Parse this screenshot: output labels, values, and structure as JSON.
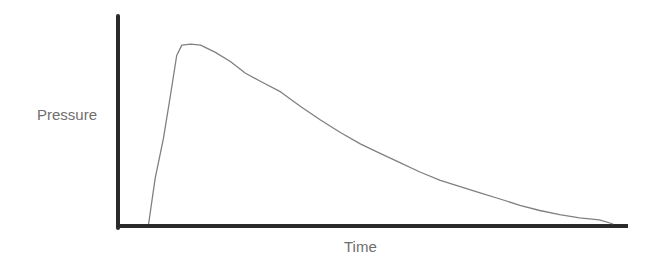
{
  "chart_data": {
    "type": "line",
    "title": "",
    "xlabel": "Time",
    "ylabel": "Pressure",
    "grid": false,
    "legend": null,
    "x_ticks": [],
    "y_ticks": [],
    "note": "Unitless schematic pressure-time curve: rapid rise to peak, then gradual decay to zero. Values normalized: x in [0,1] from origin to end of time axis, y in [0,1] from axis to top of pressure axis.",
    "xlim": [
      0,
      1
    ],
    "ylim": [
      0,
      1
    ],
    "series": [
      {
        "name": "Pressure",
        "color": "#808080",
        "x": [
          0.06,
          0.073,
          0.089,
          0.103,
          0.115,
          0.125,
          0.143,
          0.162,
          0.191,
          0.221,
          0.25,
          0.28,
          0.319,
          0.358,
          0.397,
          0.436,
          0.475,
          0.514,
          0.553,
          0.592,
          0.632,
          0.671,
          0.71,
          0.749,
          0.788,
          0.827,
          0.866,
          0.905,
          0.944,
          0.971
        ],
        "y": [
          0.0,
          0.22,
          0.41,
          0.62,
          0.81,
          0.86,
          0.865,
          0.86,
          0.825,
          0.78,
          0.725,
          0.685,
          0.635,
          0.565,
          0.5,
          0.44,
          0.385,
          0.34,
          0.295,
          0.25,
          0.21,
          0.18,
          0.15,
          0.12,
          0.09,
          0.065,
          0.045,
          0.03,
          0.02,
          0.0
        ]
      }
    ]
  },
  "labels": {
    "y_axis": "Pressure",
    "x_axis": "Time"
  },
  "style": {
    "axis_color": "#2a2a2a",
    "curve_color": "#808080",
    "label_color": "#6e6e6e"
  }
}
